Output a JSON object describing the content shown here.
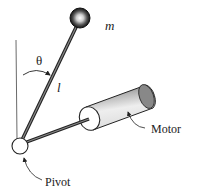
{
  "diagram": {
    "labels": {
      "mass": "m",
      "angle": "θ",
      "length": "l",
      "motor": "Motor",
      "pivot": "Pivot"
    },
    "colors": {
      "line": "#333333",
      "rod": "#555555",
      "background": "#ffffff"
    }
  }
}
